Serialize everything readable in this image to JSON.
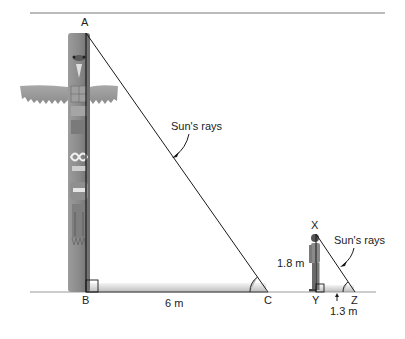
{
  "diagram": {
    "points": {
      "A": "A",
      "B": "B",
      "C": "C",
      "X": "X",
      "Y": "Y",
      "Z": "Z"
    },
    "large_triangle": {
      "object": "totem pole",
      "shadow_length": "6 m",
      "ray_label": "Sun's rays"
    },
    "small_triangle": {
      "object": "person",
      "height": "1.8 m",
      "shadow_length": "1.3 m",
      "ray_label": "Sun's rays"
    },
    "colors": {
      "line": "#1a1a1a",
      "ground": "#9a9a9a",
      "pole": "#8a8a8a",
      "shadow": "#d4d4d4"
    }
  }
}
